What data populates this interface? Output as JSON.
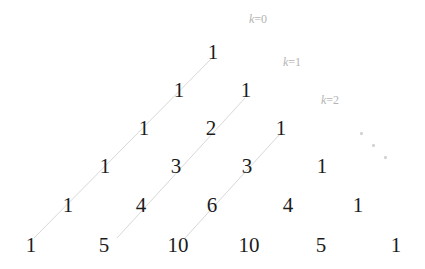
{
  "figure": {
    "background_color": "#ffffff",
    "number_color": "#1c1c1c",
    "line_color": "#d8d8d8",
    "label_color": "#b4b4b4",
    "width": 425,
    "height": 269
  },
  "chart_data": {
    "type": "table",
    "xlabel": "",
    "ylabel": "",
    "rows": [
      {
        "n": 0,
        "values": [
          1
        ]
      },
      {
        "n": 1,
        "values": [
          1,
          1
        ]
      },
      {
        "n": 2,
        "values": [
          1,
          2,
          1
        ]
      },
      {
        "n": 3,
        "values": [
          1,
          3,
          3,
          1
        ]
      },
      {
        "n": 4,
        "values": [
          1,
          4,
          6,
          4,
          1
        ]
      },
      {
        "n": 5,
        "values": [
          1,
          5,
          10,
          10,
          5,
          1
        ]
      }
    ],
    "annotations": [
      {
        "label": "k=0",
        "k": 0
      },
      {
        "label": "k=1",
        "k": 1
      },
      {
        "label": "k=2",
        "k": 2
      }
    ],
    "continuation_marker": "⋱"
  },
  "cells": [
    {
      "text": "1",
      "x": 213,
      "y": 52,
      "row": 0,
      "col": 0
    },
    {
      "text": "1",
      "x": 179,
      "y": 90,
      "row": 1,
      "col": 0
    },
    {
      "text": "1",
      "x": 246,
      "y": 90,
      "row": 1,
      "col": 1
    },
    {
      "text": "1",
      "x": 144,
      "y": 128,
      "row": 2,
      "col": 0
    },
    {
      "text": "2",
      "x": 211,
      "y": 128,
      "row": 2,
      "col": 1
    },
    {
      "text": "1",
      "x": 281,
      "y": 128,
      "row": 2,
      "col": 2
    },
    {
      "text": "1",
      "x": 105,
      "y": 166,
      "row": 3,
      "col": 0
    },
    {
      "text": "3",
      "x": 176,
      "y": 166,
      "row": 3,
      "col": 1
    },
    {
      "text": "3",
      "x": 247,
      "y": 166,
      "row": 3,
      "col": 2
    },
    {
      "text": "1",
      "x": 322,
      "y": 166,
      "row": 3,
      "col": 3
    },
    {
      "text": "1",
      "x": 68,
      "y": 205,
      "row": 4,
      "col": 0
    },
    {
      "text": "4",
      "x": 141,
      "y": 205,
      "row": 4,
      "col": 1
    },
    {
      "text": "6",
      "x": 212,
      "y": 205,
      "row": 4,
      "col": 2
    },
    {
      "text": "4",
      "x": 288,
      "y": 205,
      "row": 4,
      "col": 3
    },
    {
      "text": "1",
      "x": 358,
      "y": 205,
      "row": 4,
      "col": 4
    },
    {
      "text": "1",
      "x": 31,
      "y": 245,
      "row": 5,
      "col": 0
    },
    {
      "text": "5",
      "x": 104,
      "y": 245,
      "row": 5,
      "col": 1
    },
    {
      "text": "10",
      "x": 178,
      "y": 245,
      "row": 5,
      "col": 2
    },
    {
      "text": "10",
      "x": 249,
      "y": 245,
      "row": 5,
      "col": 3
    },
    {
      "text": "5",
      "x": 321,
      "y": 245,
      "row": 5,
      "col": 4
    },
    {
      "text": "1",
      "x": 396,
      "y": 245,
      "row": 5,
      "col": 5
    }
  ],
  "k_labels": [
    {
      "var": "k",
      "eq": "=0",
      "full": "k=0",
      "x": 258,
      "y": 19
    },
    {
      "var": "k",
      "eq": "=1",
      "full": "k=1",
      "x": 292,
      "y": 62
    },
    {
      "var": "k",
      "eq": "=2",
      "full": "k=2",
      "x": 330,
      "y": 100
    }
  ],
  "lines": [
    {
      "k": 0,
      "x1": 34,
      "y1": 238,
      "x2": 212,
      "y2": 58
    },
    {
      "k": 1,
      "x1": 117,
      "y1": 238,
      "x2": 245,
      "y2": 98
    },
    {
      "k": 2,
      "x1": 185,
      "y1": 238,
      "x2": 280,
      "y2": 134
    }
  ],
  "ellipsis": {
    "x": 372,
    "y": 144,
    "glyph": "⋱"
  }
}
